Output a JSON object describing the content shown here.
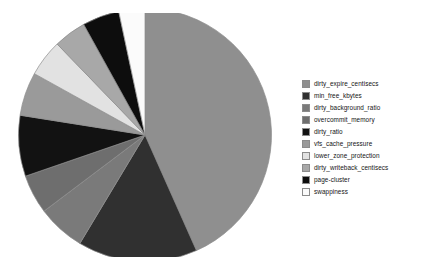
{
  "chart_data": {
    "type": "pie",
    "title": "",
    "subtitle": "",
    "xlabel": "",
    "ylabel": "",
    "grid": false,
    "legend_position": "right",
    "start_angle_deg": 90,
    "direction": "clockwise",
    "categories": [
      "dirty_expire_centisecs",
      "min_free_kbytes",
      "dirty_background_ratio",
      "overcommit_memory",
      "dirty_ratio",
      "vfs_cache_pressure",
      "lower_zone_protection",
      "dirty_writeback_centisecs",
      "page-cluster",
      "swappiness"
    ],
    "values": [
      43.3,
      15.3,
      6.1,
      5.0,
      7.8,
      5.6,
      4.7,
      4.2,
      4.7,
      3.3
    ],
    "units": "percent",
    "colors": [
      "#8f8f8f",
      "#303030",
      "#7a7a7a",
      "#6e6e6e",
      "#121212",
      "#9a9a9a",
      "#e2e2e2",
      "#a8a8a8",
      "#0d0d0d",
      "#fbfbfb"
    ],
    "slices": [
      {
        "label": "dirty_expire_centisecs",
        "value": 43.3,
        "angle_deg": 156.0,
        "color": "#8f8f8f"
      },
      {
        "label": "min_free_kbytes",
        "value": 15.3,
        "angle_deg": 55.0,
        "color": "#303030"
      },
      {
        "label": "dirty_background_ratio",
        "value": 6.1,
        "angle_deg": 22.0,
        "color": "#7a7a7a"
      },
      {
        "label": "overcommit_memory",
        "value": 5.0,
        "angle_deg": 18.0,
        "color": "#6e6e6e"
      },
      {
        "label": "dirty_ratio",
        "value": 7.8,
        "angle_deg": 28.0,
        "color": "#121212"
      },
      {
        "label": "vfs_cache_pressure",
        "value": 5.6,
        "angle_deg": 20.0,
        "color": "#9a9a9a"
      },
      {
        "label": "lower_zone_protection",
        "value": 4.7,
        "angle_deg": 17.0,
        "color": "#e2e2e2"
      },
      {
        "label": "dirty_writeback_centisecs",
        "value": 4.2,
        "angle_deg": 15.0,
        "color": "#a8a8a8"
      },
      {
        "label": "page-cluster",
        "value": 4.7,
        "angle_deg": 17.0,
        "color": "#0d0d0d"
      },
      {
        "label": "swappiness",
        "value": 3.3,
        "angle_deg": 12.0,
        "color": "#fbfbfb"
      }
    ]
  },
  "legend": {
    "items": [
      {
        "label": "dirty_expire_centisecs",
        "color": "#8f8f8f"
      },
      {
        "label": "min_free_kbytes",
        "color": "#303030"
      },
      {
        "label": "dirty_background_ratio",
        "color": "#7a7a7a"
      },
      {
        "label": "overcommit_memory",
        "color": "#6e6e6e"
      },
      {
        "label": "dirty_ratio",
        "color": "#121212"
      },
      {
        "label": "vfs_cache_pressure",
        "color": "#9a9a9a"
      },
      {
        "label": "lower_zone_protection",
        "color": "#e2e2e2"
      },
      {
        "label": "dirty_writeback_centisecs",
        "color": "#a8a8a8"
      },
      {
        "label": "page-cluster",
        "color": "#0d0d0d"
      },
      {
        "label": "swappiness",
        "color": "#fbfbfb"
      }
    ]
  },
  "figure": {
    "background_color": "#ffffff",
    "outline_color": "#8c8c8c"
  }
}
